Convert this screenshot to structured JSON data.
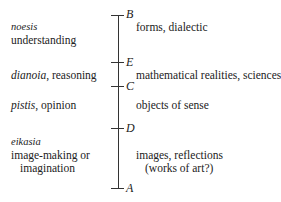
{
  "diagram": {
    "points": [
      {
        "letter": "B",
        "y": 15
      },
      {
        "letter": "E",
        "y": 62
      },
      {
        "letter": "C",
        "y": 86
      },
      {
        "letter": "D",
        "y": 128
      },
      {
        "letter": "A",
        "y": 188
      }
    ],
    "left": {
      "noesis_term": "noesis",
      "noesis_desc": "understanding",
      "dianoia_term": "dianoia",
      "dianoia_desc": ", reasoning",
      "pistis_term": "pistis",
      "pistis_desc": ", opinion",
      "eikasia_term": "eikasia",
      "eikasia_desc1": "image-making or",
      "eikasia_desc2": "imagination"
    },
    "right": {
      "forms": "forms, dialectic",
      "math": "mathematical realities, sciences",
      "sense": "objects of sense",
      "images1": "images, reflections",
      "images2": "(works of art?)"
    }
  }
}
